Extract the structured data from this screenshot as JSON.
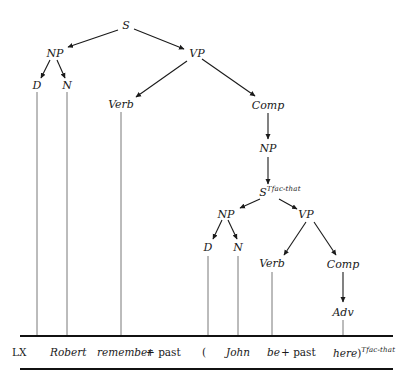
{
  "diagram": {
    "type": "phrase-structure-tree",
    "nodes": {
      "root": "S",
      "np": "NP",
      "vp": "VP",
      "d": "D",
      "n": "N",
      "verb": "Verb",
      "comp": "Comp",
      "comp_np": "NP",
      "embedded_s": "S",
      "embedded_s_sup": "Tfac-that",
      "np2": "NP",
      "vp2": "VP",
      "d2": "D",
      "n2": "N",
      "verb2": "Verb",
      "comp2": "Comp",
      "adv": "Adv"
    },
    "edges": [
      [
        "S",
        "NP"
      ],
      [
        "S",
        "VP"
      ],
      [
        "NP",
        "D"
      ],
      [
        "NP",
        "N"
      ],
      [
        "VP",
        "Verb"
      ],
      [
        "VP",
        "Comp"
      ],
      [
        "Comp",
        "NP"
      ],
      [
        "NP",
        "S^Tfac-that"
      ],
      [
        "S^Tfac-that",
        "NP"
      ],
      [
        "S^Tfac-that",
        "VP"
      ],
      [
        "NP",
        "D"
      ],
      [
        "NP",
        "N"
      ],
      [
        "VP",
        "Verb"
      ],
      [
        "VP",
        "Comp"
      ],
      [
        "Comp",
        "Adv"
      ]
    ],
    "terminal_row": {
      "label": "LX",
      "robert": "Robert",
      "remember": "remember",
      "plus_past1": "+ past",
      "open_paren": "(",
      "john": "John",
      "be": "be",
      "plus_past2": "+ past",
      "here": "here",
      "close_paren": ")",
      "close_sup": "Tfac-that"
    }
  }
}
